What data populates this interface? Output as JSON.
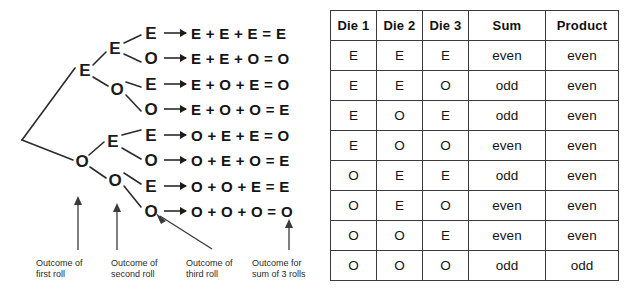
{
  "diagram": {
    "name": "probability-tree-three-dice-parity",
    "root": {
      "label": ""
    },
    "level1": [
      {
        "label": "E"
      },
      {
        "label": "O"
      }
    ],
    "level2": [
      {
        "label": "E"
      },
      {
        "label": "O"
      },
      {
        "label": "E"
      },
      {
        "label": "O"
      }
    ],
    "level3": [
      {
        "label": "E"
      },
      {
        "label": "O"
      },
      {
        "label": "E"
      },
      {
        "label": "O"
      },
      {
        "label": "E"
      },
      {
        "label": "O"
      },
      {
        "label": "E"
      },
      {
        "label": "O"
      }
    ],
    "equations": [
      "E + E + E = E",
      "E + E + O = O",
      "E + O + E = O",
      "E + O + O = E",
      "O + E + E = O",
      "O + E + O = E",
      "O + O + E = E",
      "O + O + O = O"
    ],
    "captions": [
      {
        "line1": "Outcome of",
        "line2": "first roll"
      },
      {
        "line1": "Outcome of",
        "line2": "second roll"
      },
      {
        "line1": "Outcome of",
        "line2": "third roll"
      },
      {
        "line1": "Outcome for",
        "line2": "sum of 3 rolls"
      }
    ],
    "arrow_icon": "up-arrow-icon",
    "implies_icon": "right-arrow-icon"
  },
  "table": {
    "columns": [
      "Die 1",
      "Die 2",
      "Die 3",
      "Sum",
      "Product"
    ],
    "rows": [
      [
        "E",
        "E",
        "E",
        "even",
        "even"
      ],
      [
        "E",
        "E",
        "O",
        "odd",
        "even"
      ],
      [
        "E",
        "O",
        "E",
        "odd",
        "even"
      ],
      [
        "E",
        "O",
        "O",
        "even",
        "even"
      ],
      [
        "O",
        "E",
        "E",
        "odd",
        "even"
      ],
      [
        "O",
        "E",
        "O",
        "even",
        "even"
      ],
      [
        "O",
        "O",
        "E",
        "even",
        "even"
      ],
      [
        "O",
        "O",
        "O",
        "odd",
        "odd"
      ]
    ]
  },
  "colors": {
    "ink": "#1a1a1a",
    "line": "#3a3a3a",
    "background": "#ffffff"
  }
}
